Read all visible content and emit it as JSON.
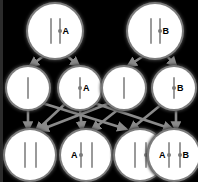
{
  "diagram": {
    "background_color": "#000000",
    "cell_fill_color": "#ffffff",
    "cell_ring_color": "#7c7c7c",
    "chromatid_color": "#9a9a9a",
    "centromere_color": "#7a7a7a",
    "arrow_color": "#8a8a8a",
    "label_color": "#000000"
  },
  "rows": [
    {
      "name": "parent-generation",
      "index": 0,
      "cells": [
        {
          "id": "p1",
          "cx": 55,
          "cy": 31,
          "r": 27,
          "chromosome_count": 2,
          "chrom_height": 26,
          "chrom_width": 2,
          "spacing": 7,
          "has_centromere": true,
          "labels": [
            {
              "text": "A",
              "side": "right",
              "size": 9
            }
          ]
        },
        {
          "id": "p2",
          "cx": 155,
          "cy": 31,
          "r": 27,
          "chromosome_count": 2,
          "chrom_height": 26,
          "chrom_width": 2,
          "spacing": 7,
          "has_centromere": true,
          "labels": [
            {
              "text": "B",
              "side": "right",
              "size": 9
            }
          ]
        }
      ]
    },
    {
      "name": "gamete-generation",
      "index": 1,
      "cells": [
        {
          "id": "g1",
          "cx": 28,
          "cy": 88,
          "r": 21,
          "chromosome_count": 1,
          "chrom_height": 22,
          "chrom_width": 2,
          "spacing": 0,
          "has_centromere": false,
          "labels": []
        },
        {
          "id": "g2",
          "cx": 80,
          "cy": 88,
          "r": 21,
          "chromosome_count": 1,
          "chrom_height": 22,
          "chrom_width": 2,
          "spacing": 0,
          "has_centromere": true,
          "labels": [
            {
              "text": "A",
              "side": "right",
              "size": 9
            }
          ]
        },
        {
          "id": "g3",
          "cx": 124,
          "cy": 88,
          "r": 21,
          "chromosome_count": 1,
          "chrom_height": 22,
          "chrom_width": 2,
          "spacing": 0,
          "has_centromere": false,
          "labels": []
        },
        {
          "id": "g4",
          "cx": 174,
          "cy": 88,
          "r": 21,
          "chromosome_count": 1,
          "chrom_height": 22,
          "chrom_width": 2,
          "spacing": 0,
          "has_centromere": true,
          "labels": [
            {
              "text": "B",
              "side": "right",
              "size": 9
            }
          ]
        }
      ]
    },
    {
      "name": "offspring-generation",
      "index": 2,
      "cells": [
        {
          "id": "o1",
          "cx": 30,
          "cy": 155,
          "r": 25,
          "chromosome_count": 2,
          "chrom_height": 26,
          "chrom_width": 2,
          "spacing": 9,
          "has_centromere": false,
          "labels": []
        },
        {
          "id": "o2",
          "cx": 86,
          "cy": 155,
          "r": 25,
          "chromosome_count": 2,
          "chrom_height": 26,
          "chrom_width": 2,
          "spacing": 9,
          "has_centromere": true,
          "centromere_on": [
            0
          ],
          "labels": [
            {
              "text": "A",
              "side": "left",
              "size": 9
            }
          ]
        },
        {
          "id": "o3",
          "cx": 140,
          "cy": 155,
          "r": 25,
          "chromosome_count": 2,
          "chrom_height": 26,
          "chrom_width": 2,
          "spacing": 9,
          "has_centromere": true,
          "centromere_on": [
            1
          ],
          "labels": [
            {
              "text": "B",
              "side": "right",
              "size": 9
            }
          ]
        },
        {
          "id": "o4",
          "cx": 174,
          "cy": 155,
          "r": 25,
          "chromosome_count": 2,
          "chrom_height": 26,
          "chrom_width": 2,
          "spacing": 9,
          "has_centromere": true,
          "centromere_on": [
            0,
            1
          ],
          "labels": [
            {
              "text": "A",
              "side": "left",
              "size": 9
            },
            {
              "text": "B",
              "side": "right",
              "size": 9
            }
          ]
        }
      ]
    }
  ],
  "edges": [
    {
      "from": "p1",
      "to": "g1",
      "x1": 45,
      "y1": 55,
      "x2": 30,
      "y2": 66
    },
    {
      "from": "p1",
      "to": "g2",
      "x1": 66,
      "y1": 55,
      "x2": 79,
      "y2": 66
    },
    {
      "from": "p2",
      "to": "g3",
      "x1": 145,
      "y1": 55,
      "x2": 128,
      "y2": 66
    },
    {
      "from": "p2",
      "to": "g4",
      "x1": 166,
      "y1": 55,
      "x2": 176,
      "y2": 66
    },
    {
      "from": "g1",
      "to": "o1",
      "x1": 28,
      "y1": 110,
      "x2": 28,
      "y2": 130
    },
    {
      "from": "g1",
      "to": "o3",
      "x1": 42,
      "y1": 103,
      "x2": 126,
      "y2": 129
    },
    {
      "from": "g2",
      "to": "o2",
      "x1": 80,
      "y1": 110,
      "x2": 82,
      "y2": 130
    },
    {
      "from": "g2",
      "to": "o4",
      "x1": 94,
      "y1": 103,
      "x2": 172,
      "y2": 129
    },
    {
      "from": "g3",
      "to": "o1",
      "x1": 110,
      "y1": 103,
      "x2": 40,
      "y2": 130
    },
    {
      "from": "g3",
      "to": "o2",
      "x1": 120,
      "y1": 108,
      "x2": 92,
      "y2": 130
    },
    {
      "from": "g4",
      "to": "o3",
      "x1": 162,
      "y1": 104,
      "x2": 130,
      "y2": 130
    },
    {
      "from": "g4",
      "to": "o4",
      "x1": 176,
      "y1": 110,
      "x2": 176,
      "y2": 130
    },
    {
      "from": "g2",
      "to": "o1",
      "x1": 66,
      "y1": 103,
      "x2": 36,
      "y2": 131
    }
  ]
}
